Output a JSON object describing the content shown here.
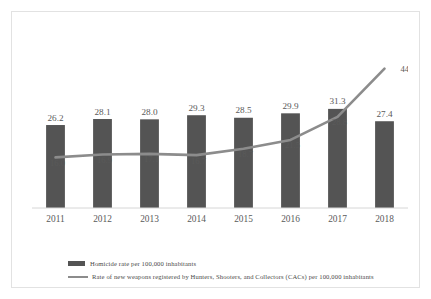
{
  "figure": {
    "background": "#ffffff",
    "border_color": "#e2e2e2"
  },
  "legend": {
    "position": "bottom",
    "items": [
      {
        "name": "homicide-rate",
        "label": "Homicide rate per 100,000 inhabitants",
        "marker": "bar-swatch",
        "color": "#545454"
      },
      {
        "name": "cac-weapons-rate",
        "label": "Rate of new weapons registered by Hunters, Shooters, and Collectors (CACs) per 100,000 inhabitants",
        "marker": "line-swatch",
        "color": "#8c8c8c"
      }
    ]
  },
  "chart_data": {
    "type": "bar",
    "title": "",
    "subtitle": "",
    "xlabel": "",
    "ylabel": "",
    "grid": false,
    "legend_position": "bottom",
    "ylim": [
      0,
      48
    ],
    "categories": [
      "2011",
      "2012",
      "2013",
      "2014",
      "2015",
      "2016",
      "2017",
      "2018"
    ],
    "series": [
      {
        "name": "Homicide rate per 100,000 inhabitants",
        "type": "bar",
        "color": "#545454",
        "values": [
          26.2,
          28.1,
          28.0,
          29.3,
          28.5,
          29.9,
          31.3,
          27.4
        ],
        "labels": [
          "26.2",
          "28.1",
          "28.0",
          "29.3",
          "28.5",
          "29.9",
          "31.3",
          "27.4"
        ]
      },
      {
        "name": "Rate of new weapons registered by Hunters, Shooters, and Collectors (CACs) per 100,000 inhabitants",
        "type": "line",
        "color": "#8c8c8c",
        "values": [
          16.0,
          16.9,
          17.1,
          16.7,
          18.7,
          21.5,
          28.8,
          44.0
        ],
        "labels": [
          "16.0",
          "16.9",
          "17.1",
          "16.7",
          "18.7",
          "21.5",
          "28.8",
          "44.0"
        ]
      }
    ]
  }
}
